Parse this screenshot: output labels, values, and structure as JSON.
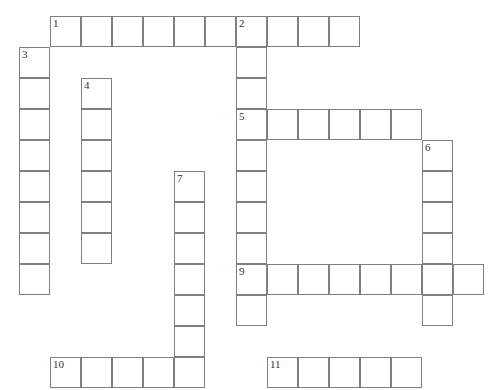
{
  "puzzle": {
    "title": "Crossword puzzle grid",
    "cell_size": 31,
    "origin_x": 19,
    "origin_y": 16,
    "grid_columns": 16,
    "grid_rows": 12,
    "cell_border_color": "#808080",
    "cell_fill_color": "#ffffff",
    "background_color": "#ffffff",
    "number_color": "#333333",
    "entries": [
      {
        "number": "1",
        "direction": "across",
        "row": 0,
        "col": 1,
        "length": 10
      },
      {
        "number": "2",
        "direction": "down",
        "row": 0,
        "col": 7,
        "length": 10
      },
      {
        "number": "3",
        "direction": "down",
        "row": 1,
        "col": 0,
        "length": 8
      },
      {
        "number": "4",
        "direction": "down",
        "row": 2,
        "col": 2,
        "length": 6
      },
      {
        "number": "5",
        "direction": "across",
        "row": 3,
        "col": 7,
        "length": 6
      },
      {
        "number": "6",
        "direction": "down",
        "row": 4,
        "col": 13,
        "length": 6
      },
      {
        "number": "7",
        "direction": "down",
        "row": 5,
        "col": 5,
        "length": 7
      },
      {
        "number": "9",
        "direction": "across",
        "row": 8,
        "col": 7,
        "length": 8
      },
      {
        "number": "10",
        "direction": "across",
        "row": 11,
        "col": 1,
        "length": 5
      },
      {
        "number": "11",
        "direction": "across",
        "row": 11,
        "col": 8,
        "length": 5
      }
    ],
    "numbered_cells": [
      {
        "label": "1",
        "row": 0,
        "col": 1
      },
      {
        "label": "2",
        "row": 0,
        "col": 7
      },
      {
        "label": "3",
        "row": 1,
        "col": 0
      },
      {
        "label": "4",
        "row": 2,
        "col": 2
      },
      {
        "label": "5",
        "row": 3,
        "col": 7
      },
      {
        "label": "6",
        "row": 4,
        "col": 13
      },
      {
        "label": "7",
        "row": 5,
        "col": 5
      },
      {
        "label": "9",
        "row": 8,
        "col": 7
      },
      {
        "label": "10",
        "row": 11,
        "col": 1
      },
      {
        "label": "11",
        "row": 11,
        "col": 8
      }
    ]
  }
}
